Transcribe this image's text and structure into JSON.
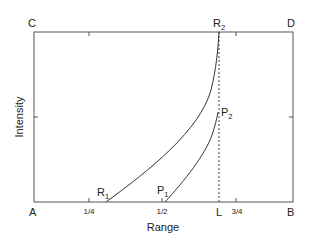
{
  "diagram": {
    "corners": {
      "A": "A",
      "B": "B",
      "C": "C",
      "D": "D"
    },
    "x_axis_label": "Range",
    "y_axis_label": "Intensity",
    "x_ticks": [
      {
        "label": "1/4",
        "x": 89
      },
      {
        "label": "1/2",
        "x": 162
      },
      {
        "label": "L",
        "x": 219
      },
      {
        "label": "3/4",
        "x": 236
      }
    ],
    "points": {
      "R1": {
        "letter": "R",
        "sub": "1"
      },
      "R2": {
        "letter": "R",
        "sub": "2"
      },
      "P1": {
        "letter": "P",
        "sub": "1"
      },
      "P2": {
        "letter": "P",
        "sub": "2"
      }
    },
    "curves": [
      {
        "name": "R-curve",
        "from": "R1",
        "to": "R2"
      },
      {
        "name": "P-curve",
        "from": "P1",
        "to": "P2"
      }
    ],
    "dashed_line": "L",
    "colors": {
      "line": "#333333",
      "text": "#222222",
      "background": "#ffffff"
    }
  }
}
